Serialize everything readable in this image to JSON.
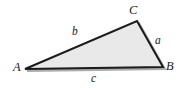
{
  "figure": {
    "kind": "triangle-diagram",
    "background_color": "#ffffff",
    "fill_color": "#e9e9e9",
    "stroke_color": "#1c1c1c",
    "shadow_color": "#9a9a9a",
    "vertices": [
      {
        "name": "A",
        "label": "A",
        "x": 25,
        "y": 69
      },
      {
        "name": "B",
        "label": "B",
        "x": 163,
        "y": 67
      },
      {
        "name": "C",
        "label": "C",
        "x": 137,
        "y": 21
      }
    ],
    "sides": [
      {
        "name": "a",
        "label": "a",
        "from": "B",
        "to": "C"
      },
      {
        "name": "b",
        "label": "b",
        "from": "A",
        "to": "C"
      },
      {
        "name": "c",
        "label": "c",
        "from": "A",
        "to": "B"
      }
    ],
    "labels": {
      "vertex_A": "A",
      "vertex_B": "B",
      "vertex_C": "C",
      "side_a": "a",
      "side_b": "b",
      "side_c": "c"
    }
  }
}
